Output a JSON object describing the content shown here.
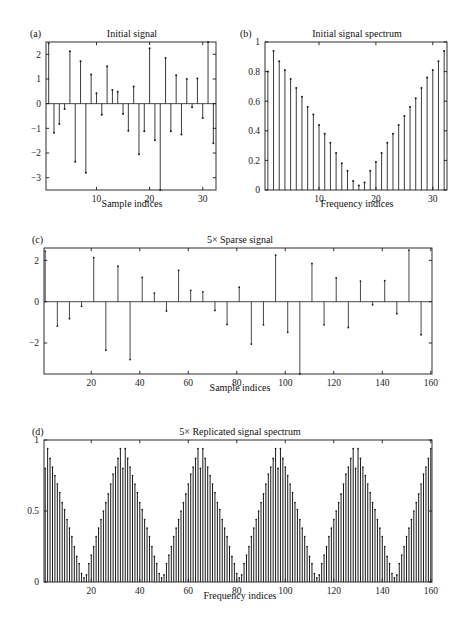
{
  "figure": {
    "width": 462,
    "height": 618,
    "background": "#ffffff",
    "ink": "#1a1a1a"
  },
  "panels": [
    {
      "id": "a",
      "label": "(a)",
      "title": "Initial signal",
      "xlabel": "Sample indices",
      "ylabel": "",
      "xticks": [
        10,
        20,
        30
      ],
      "yticks": [
        -3,
        -2,
        -1,
        0,
        1,
        2
      ],
      "xlim": [
        0.5,
        32.5
      ],
      "ylim": [
        -3.5,
        2.5
      ]
    },
    {
      "id": "b",
      "label": "(b)",
      "title": "Initial signal spectrum",
      "xlabel": "Frequency indices",
      "ylabel": "",
      "xticks": [
        10,
        20,
        30
      ],
      "yticks": [
        0,
        0.2,
        0.4,
        0.6,
        0.8,
        1
      ],
      "xlim": [
        0.5,
        32.5
      ],
      "ylim": [
        0,
        1
      ]
    },
    {
      "id": "c",
      "label": "(c)",
      "title": "5× Sparse signal",
      "xlabel": "Sample indices",
      "ylabel": "",
      "xticks": [
        20,
        40,
        60,
        80,
        100,
        120,
        140,
        160
      ],
      "yticks": [
        -2,
        0,
        2
      ],
      "xlim": [
        0.5,
        160.5
      ],
      "ylim": [
        -3.5,
        2.6
      ]
    },
    {
      "id": "d",
      "label": "(d)",
      "title": "5× Replicated signal spectrum",
      "xlabel": "Frequency indices",
      "ylabel": "",
      "xticks": [
        20,
        40,
        60,
        80,
        100,
        120,
        140,
        160
      ],
      "yticks": [
        0,
        0.5,
        1
      ],
      "xlim": [
        0.5,
        160.5
      ],
      "ylim": [
        0,
        1
      ]
    }
  ],
  "chart_data": [
    {
      "type": "stem",
      "panel": "a",
      "title": "Initial signal",
      "xlabel": "Sample indices",
      "ylabel": "",
      "xlim": [
        0.5,
        32.5
      ],
      "ylim": [
        -3.5,
        2.5
      ],
      "xticks": [
        10,
        20,
        30
      ],
      "yticks": [
        -3,
        -2,
        -1,
        0,
        1,
        2
      ],
      "grid": false,
      "legend": null,
      "x": [
        1,
        2,
        3,
        4,
        5,
        6,
        7,
        8,
        9,
        10,
        11,
        12,
        13,
        14,
        15,
        16,
        17,
        18,
        19,
        20,
        21,
        22,
        23,
        24,
        25,
        26,
        27,
        28,
        29,
        30,
        31,
        32
      ],
      "values": [
        2.45,
        -1.18,
        -0.82,
        -0.22,
        2.13,
        -2.35,
        1.72,
        -2.8,
        1.18,
        0.42,
        -0.45,
        1.52,
        0.55,
        0.48,
        -0.42,
        -1.1,
        0.7,
        -2.05,
        -1.12,
        2.25,
        -1.48,
        -3.5,
        1.85,
        -1.12,
        1.15,
        -1.25,
        1.0,
        -0.15,
        1.02,
        -0.58,
        2.5,
        -1.6
      ]
    },
    {
      "type": "stem",
      "panel": "b",
      "title": "Initial signal spectrum",
      "xlabel": "Frequency indices",
      "ylabel": "",
      "xlim": [
        0.5,
        32.5
      ],
      "ylim": [
        0,
        1
      ],
      "xticks": [
        10,
        20,
        30
      ],
      "yticks": [
        0,
        0.2,
        0.4,
        0.6,
        0.8,
        1
      ],
      "grid": false,
      "legend": null,
      "x": [
        1,
        2,
        3,
        4,
        5,
        6,
        7,
        8,
        9,
        10,
        11,
        12,
        13,
        14,
        15,
        16,
        17,
        18,
        19,
        20,
        21,
        22,
        23,
        24,
        25,
        26,
        27,
        28,
        29,
        30,
        31,
        32
      ],
      "values": [
        0.8,
        0.94,
        0.87,
        0.81,
        0.75,
        0.69,
        0.63,
        0.56,
        0.51,
        0.44,
        0.38,
        0.32,
        0.25,
        0.18,
        0.13,
        0.06,
        0.03,
        0.05,
        0.13,
        0.19,
        0.25,
        0.32,
        0.38,
        0.44,
        0.5,
        0.56,
        0.62,
        0.69,
        0.76,
        0.81,
        0.87,
        0.94
      ]
    },
    {
      "type": "stem",
      "panel": "c",
      "title": "5× Sparse signal",
      "xlabel": "Sample indices",
      "ylabel": "",
      "xlim": [
        0.5,
        160.5
      ],
      "ylim": [
        -3.5,
        2.6
      ],
      "xticks": [
        20,
        40,
        60,
        80,
        100,
        120,
        140,
        160
      ],
      "yticks": [
        -2,
        0,
        2
      ],
      "grid": false,
      "legend": null,
      "note": "Panel (a) upsampled by 5: nonzero only at indices 1,6,11,...,156; zeros elsewhere.",
      "upsample_factor": 5,
      "nonzero_values": [
        2.45,
        -1.18,
        -0.82,
        -0.22,
        2.13,
        -2.35,
        1.72,
        -2.8,
        1.18,
        0.42,
        -0.45,
        1.52,
        0.55,
        0.48,
        -0.42,
        -1.1,
        0.7,
        -2.05,
        -1.12,
        2.25,
        -1.48,
        -3.5,
        1.85,
        -1.12,
        1.15,
        -1.25,
        1.0,
        -0.15,
        1.02,
        -0.58,
        2.5,
        -1.6
      ]
    },
    {
      "type": "stem",
      "panel": "d",
      "title": "5× Replicated signal spectrum",
      "xlabel": "Frequency indices",
      "ylabel": "",
      "xlim": [
        0.5,
        160.5
      ],
      "ylim": [
        0,
        1
      ],
      "xticks": [
        20,
        40,
        60,
        80,
        100,
        120,
        140,
        160
      ],
      "yticks": [
        0,
        0.5,
        1
      ],
      "grid": false,
      "legend": null,
      "note": "Panel (b) spectrum tiled 5 times, period 32 samples.",
      "replications": 5,
      "period": 32,
      "base_values": [
        0.8,
        0.94,
        0.87,
        0.81,
        0.75,
        0.69,
        0.63,
        0.56,
        0.51,
        0.44,
        0.38,
        0.32,
        0.25,
        0.18,
        0.13,
        0.06,
        0.03,
        0.05,
        0.13,
        0.19,
        0.25,
        0.32,
        0.38,
        0.44,
        0.5,
        0.56,
        0.62,
        0.69,
        0.76,
        0.81,
        0.87,
        0.94
      ]
    }
  ]
}
